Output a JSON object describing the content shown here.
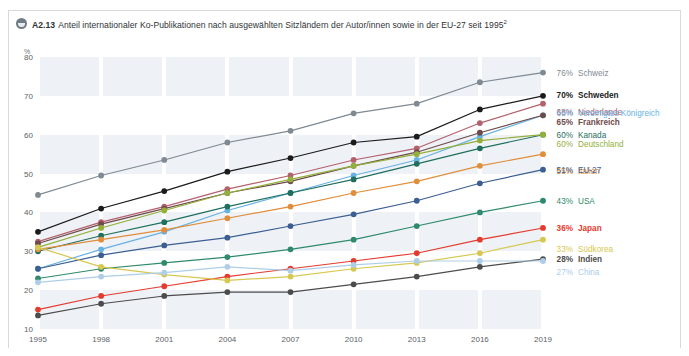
{
  "header": {
    "icon": "clock-icon",
    "code": "A2.13",
    "title": "Anteil internationaler Ko-Publikationen nach ausgewählten Sitzländern der Autor/innen sowie in der EU-27 seit 1995",
    "footnote_marker": "2"
  },
  "chart_data": {
    "type": "line",
    "title": "Anteil internationaler Ko-Publikationen nach ausgewählten Sitzländern der Autor/innen sowie in der EU-27 seit 1995",
    "xlabel": "",
    "ylabel": "%",
    "unit_label": "%",
    "x": [
      "1995",
      "1998",
      "2001",
      "2004",
      "2007",
      "2010",
      "2013",
      "2016",
      "2019"
    ],
    "xlim": [
      1995,
      2019
    ],
    "ylim": [
      10,
      80
    ],
    "yticks": [
      10,
      20,
      30,
      40,
      50,
      60,
      70,
      80
    ],
    "grid": "horizontal-bands",
    "legend_position": "right",
    "series": [
      {
        "name": "Schweiz",
        "end_value": 76,
        "label": "76%",
        "color": "#7f8a93",
        "bold": false,
        "values": [
          44.5,
          49.5,
          53.5,
          58.0,
          61.0,
          65.5,
          68.0,
          73.5,
          76.0
        ]
      },
      {
        "name": "Schweden",
        "end_value": 70,
        "label": "70%",
        "color": "#1b1b1b",
        "bold": true,
        "values": [
          35.0,
          41.0,
          45.5,
          50.5,
          54.0,
          58.0,
          59.5,
          66.5,
          70.0
        ]
      },
      {
        "name": "Niederlande",
        "end_value": 68,
        "label": "68%",
        "color": "#b4616e",
        "bold": false,
        "values": [
          32.5,
          37.5,
          41.5,
          46.0,
          49.5,
          53.5,
          56.5,
          63.0,
          68.0
        ]
      },
      {
        "name": "Vereinigtes Königreich",
        "end_value": 65,
        "label": "65%",
        "color": "#67b2e3",
        "bold": false,
        "values": [
          25.5,
          30.5,
          35.0,
          40.5,
          45.0,
          49.5,
          53.5,
          59.5,
          65.0
        ]
      },
      {
        "name": "Frankreich",
        "end_value": 65,
        "label": "65%",
        "color": "#6e4a4a",
        "bold": true,
        "values": [
          32.0,
          37.0,
          41.0,
          45.0,
          48.0,
          52.0,
          55.5,
          60.5,
          65.0
        ]
      },
      {
        "name": "Kanada",
        "end_value": 60,
        "label": "60%",
        "color": "#1f6f5e",
        "bold": false,
        "values": [
          30.0,
          34.0,
          37.5,
          41.5,
          45.0,
          48.5,
          52.5,
          56.5,
          60.0
        ]
      },
      {
        "name": "Deutschland",
        "end_value": 60,
        "label": "60%",
        "color": "#93b03a",
        "bold": false,
        "values": [
          31.0,
          36.0,
          40.5,
          45.0,
          48.5,
          52.0,
          55.0,
          58.5,
          60.0
        ]
      },
      {
        "name": "Italien",
        "end_value": 55,
        "label": "55%",
        "color": "#e08e3c",
        "bold": false,
        "values": [
          30.5,
          33.0,
          35.5,
          38.5,
          41.5,
          45.0,
          48.0,
          52.0,
          55.0
        ]
      },
      {
        "name": "EU-27",
        "end_value": 51,
        "label": "51%",
        "color": "#3c5f93",
        "bold": false,
        "values": [
          25.5,
          29.0,
          31.5,
          33.5,
          36.5,
          39.5,
          43.0,
          47.5,
          51.0
        ]
      },
      {
        "name": "USA",
        "end_value": 43,
        "label": "43%",
        "color": "#2f8a6b",
        "bold": false,
        "values": [
          23.0,
          25.5,
          27.0,
          28.5,
          30.5,
          33.0,
          36.5,
          40.0,
          43.0
        ]
      },
      {
        "name": "Japan",
        "end_value": 36,
        "label": "36%",
        "color": "#e53b2e",
        "bold": true,
        "values": [
          15.0,
          18.5,
          21.0,
          23.5,
          25.5,
          27.5,
          29.5,
          33.0,
          36.0
        ]
      },
      {
        "name": "Südkorea",
        "end_value": 33,
        "label": "33%",
        "color": "#d6c850",
        "bold": false,
        "values": [
          31.0,
          26.0,
          24.0,
          22.5,
          23.5,
          25.5,
          27.0,
          29.5,
          33.0
        ]
      },
      {
        "name": "Indien",
        "end_value": 28,
        "label": "28%",
        "color": "#4c4c4c",
        "bold": true,
        "values": [
          13.5,
          16.5,
          18.5,
          19.5,
          19.5,
          21.5,
          23.5,
          26.0,
          28.0
        ]
      },
      {
        "name": "China",
        "end_value": 27,
        "label": "27%",
        "color": "#aecde8",
        "bold": false,
        "values": [
          22.0,
          23.5,
          24.5,
          26.0,
          25.0,
          26.5,
          27.5,
          27.5,
          27.5
        ]
      }
    ]
  },
  "legend_groups": [
    {
      "items": [
        "Schweiz"
      ]
    },
    {
      "items": [
        "Schweden",
        "Niederlande"
      ]
    },
    {
      "items": [
        "Vereinigtes Königreich",
        "Frankreich"
      ]
    },
    {
      "items": [
        "Kanada",
        "Deutschland",
        "Italien"
      ]
    },
    {
      "items": [
        "EU-27"
      ]
    },
    {
      "items": [
        "USA"
      ]
    },
    {
      "items": [
        "Japan",
        "Südkorea"
      ]
    },
    {
      "items": [
        "Indien",
        "China"
      ]
    }
  ]
}
